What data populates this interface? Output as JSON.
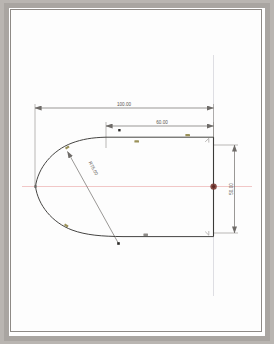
{
  "drawing": {
    "title": "cad-sketch-pointed-profile",
    "sheet_background": "#fdfdfd",
    "frame_color": "#8e8a86",
    "mat_color": "#a9a5a1"
  },
  "colors": {
    "geometry": "#3b3a38",
    "dimension": "#6e6b68",
    "centerline": "#e8b0b0",
    "construction": "#d9d9de",
    "constraint_marker": "#9a9159",
    "point_marker": "#2b2a28",
    "highlight_point": "#7a3a33",
    "text": "#55524f"
  },
  "dimensions": {
    "overall_length": {
      "label": "100.00",
      "name": "overall-length-dimension",
      "orientation": "horizontal"
    },
    "body_length": {
      "label": "60.00",
      "name": "body-length-dimension",
      "orientation": "horizontal"
    },
    "height": {
      "label": "50.00",
      "name": "height-dimension",
      "orientation": "vertical"
    },
    "radius": {
      "label": "R75.00",
      "name": "arc-radius-dimension",
      "orientation": "diagonal"
    }
  },
  "geometry": {
    "description": "pointed profile: two tangent arcs meeting at a left apex, blended into top and bottom horizontal lines closed by a right vertical edge",
    "nose_apex": "left-point",
    "right_edge": "vertical-line",
    "top_edge": "horizontal-line",
    "bottom_edge": "horizontal-line"
  },
  "markers": {
    "tangent_constraints": [
      {
        "name": "tangent-marker-top-left"
      },
      {
        "name": "tangent-marker-bottom-left"
      }
    ],
    "horizontal_constraints": [
      {
        "name": "horizontal-marker-top-1"
      },
      {
        "name": "horizontal-marker-top-2"
      },
      {
        "name": "horizontal-marker-bottom-1"
      }
    ],
    "coincident_points": [
      {
        "name": "coincident-marker-top-right"
      },
      {
        "name": "coincident-marker-bottom-right"
      }
    ],
    "points": [
      {
        "name": "arc-center-point-lower"
      },
      {
        "name": "arc-center-point-upper"
      },
      {
        "name": "selected-midpoint"
      }
    ]
  }
}
